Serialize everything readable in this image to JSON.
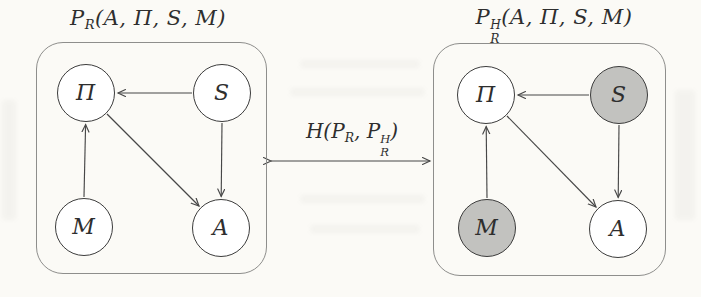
{
  "figure": {
    "left_model": {
      "title": {
        "base": "P",
        "sub": "R",
        "args": "(A, Π, S, M)"
      },
      "nodes": {
        "pi": {
          "label": "Π",
          "shaded": false
        },
        "s": {
          "label": "S",
          "shaded": false
        },
        "m": {
          "label": "M",
          "shaded": false
        },
        "a": {
          "label": "A",
          "shaded": false
        }
      },
      "edges": [
        {
          "from": "S",
          "to": "Π"
        },
        {
          "from": "S",
          "to": "A"
        },
        {
          "from": "Π",
          "to": "A"
        },
        {
          "from": "M",
          "to": "Π"
        }
      ]
    },
    "right_model": {
      "title": {
        "base": "P",
        "sup": "H",
        "sub": "R",
        "args": "(A, Π, S, M)"
      },
      "nodes": {
        "pi": {
          "label": "Π",
          "shaded": false
        },
        "s": {
          "label": "S",
          "shaded": true
        },
        "m": {
          "label": "M",
          "shaded": true
        },
        "a": {
          "label": "A",
          "shaded": false
        }
      },
      "edges": [
        {
          "from": "S",
          "to": "Π"
        },
        {
          "from": "S",
          "to": "A"
        },
        {
          "from": "Π",
          "to": "A"
        },
        {
          "from": "M",
          "to": "Π"
        }
      ]
    },
    "divergence_label": {
      "base": "H",
      "open": "(",
      "arg1_base": "P",
      "arg1_sub": "R",
      "separator": ", ",
      "arg2_base": "P",
      "arg2_sup": "H",
      "arg2_sub": "R",
      "close": ")"
    },
    "colors": {
      "node_fill": "#ffffff",
      "shaded_node_fill": "#c2c2bf",
      "node_stroke": "#3c3c3c",
      "edge_stroke": "#474747",
      "box_stroke": "#8e8e8c",
      "background": "#fbfaf6"
    }
  }
}
